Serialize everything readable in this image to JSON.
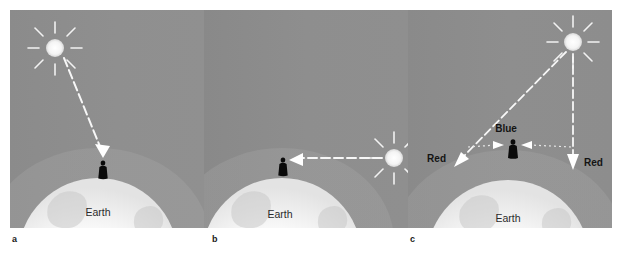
{
  "figure": {
    "background_color": "#ffffff",
    "sky_color": "#8d8d8d",
    "earth_color": "#fbfbfb",
    "ray_color": "#ffffff",
    "text_color": "#1a1a1a"
  },
  "panels": [
    {
      "caption": "a",
      "earth_label": "Earth",
      "sun": {
        "name": "sun-icon",
        "position": "upper-left"
      },
      "rays": [
        {
          "label": "",
          "name": "sunlight-ray-overhead",
          "direction": "down-right",
          "style": "dashed-arrow"
        }
      ],
      "figure_person": "observer-silhouette"
    },
    {
      "caption": "b",
      "earth_label": "Earth",
      "sun": {
        "name": "sun-icon",
        "position": "right-horizon"
      },
      "rays": [
        {
          "label": "",
          "name": "sunlight-ray-horizon",
          "direction": "left",
          "style": "dashed-arrow"
        }
      ],
      "figure_person": "observer-silhouette"
    },
    {
      "caption": "c",
      "earth_label": "Earth",
      "sun": {
        "name": "sun-icon",
        "position": "upper-right"
      },
      "rays": [
        {
          "label": "Red",
          "name": "red-ray-left",
          "direction": "down-left",
          "style": "dashed-arrow"
        },
        {
          "label": "Red",
          "name": "red-ray-right",
          "direction": "down",
          "style": "dashed-arrow"
        },
        {
          "label": "Blue",
          "name": "blue-scatter-rays",
          "direction": "inward",
          "style": "dotted-arrow"
        }
      ],
      "figure_person": "observer-silhouette"
    }
  ]
}
